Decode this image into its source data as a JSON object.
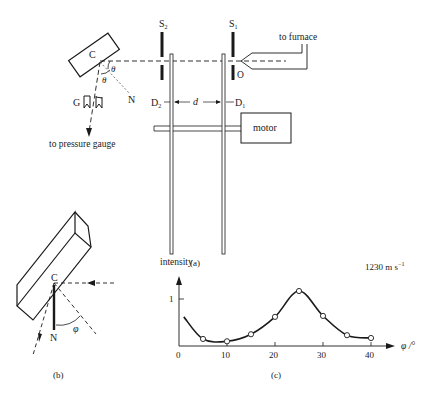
{
  "panel_a": {
    "caption": "(a)",
    "labels": {
      "S2": "S",
      "S2_sub": "2",
      "S1": "S",
      "S1_sub": "1",
      "to_furnace": "to furnace",
      "O": "O",
      "C": "C",
      "theta1": "θ",
      "theta2": "θ",
      "N": "N",
      "G": "G",
      "D2": "D",
      "D2_sub": "2",
      "D1": "D",
      "D1_sub": "1",
      "d": "d",
      "motor": "motor",
      "to_pressure_gauge": "to pressure gauge"
    }
  },
  "panel_b": {
    "caption": "(b)",
    "labels": {
      "C": "C",
      "N": "N",
      "phi": "φ"
    }
  },
  "panel_c": {
    "caption": "(c)",
    "ylabel": "intensity",
    "xlabel": "φ /°",
    "speed_label": "1230 m  s",
    "speed_sup": "−1",
    "y_tick": "1",
    "x_ticks": [
      "0",
      "10",
      "20",
      "30",
      "40"
    ]
  },
  "chart_data": {
    "type": "line",
    "xlabel": "φ /°",
    "ylabel": "intensity",
    "x": [
      5,
      10,
      15,
      20,
      25,
      30,
      35,
      40
    ],
    "values": [
      0.15,
      0.1,
      0.25,
      0.62,
      1.17,
      0.64,
      0.23,
      0.17
    ],
    "curve_start": {
      "x": 1,
      "y": 0.62
    },
    "x_ticks": [
      0,
      10,
      20,
      30,
      40
    ],
    "y_ticks": [
      1
    ],
    "xlim": [
      0,
      42
    ],
    "ylim": [
      0,
      1.4
    ],
    "grid": false,
    "markers": "open-circle"
  }
}
